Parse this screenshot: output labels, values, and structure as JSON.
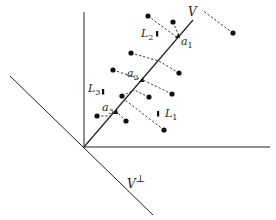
{
  "diagram": {
    "origin": [
      84,
      147
    ],
    "axes": {
      "vertical": {
        "from": [
          84,
          147
        ],
        "to": [
          84,
          12
        ]
      },
      "horizontal": {
        "from": [
          84,
          147
        ],
        "to": [
          270,
          147
        ]
      },
      "v_perp": {
        "from": [
          10,
          76
        ],
        "to": [
          153,
          215
        ],
        "label": "V",
        "label_sup": "⊥"
      },
      "v": {
        "from": [
          84,
          147
        ],
        "to": [
          193,
          20
        ],
        "label": "V"
      }
    },
    "points": [
      {
        "p": [
          148,
          16
        ],
        "proj": [
          178,
          38
        ]
      },
      {
        "p": [
          173,
          22
        ],
        "proj": [
          179,
          36
        ]
      },
      {
        "p": [
          233,
          33
        ],
        "proj": [
          202,
          10
        ]
      },
      {
        "p": [
          131,
          53
        ],
        "proj": [
          159,
          61
        ]
      },
      {
        "p": [
          113,
          70
        ],
        "proj": [
          143,
          80
        ]
      },
      {
        "p": [
          179,
          73
        ],
        "proj": [
          159,
          61
        ]
      },
      {
        "p": [
          172,
          94
        ],
        "proj": [
          143,
          80
        ]
      },
      {
        "p": [
          149,
          97
        ],
        "proj": [
          134,
          90
        ]
      },
      {
        "p": [
          122,
          96
        ],
        "proj": [
          134,
          90
        ]
      },
      {
        "p": [
          97,
          116
        ],
        "proj": [
          111,
          116
        ]
      },
      {
        "p": [
          126,
          121
        ],
        "proj": [
          116,
          111
        ]
      },
      {
        "p": [
          164,
          130
        ],
        "proj": [
          125,
          100
        ]
      }
    ],
    "anchors": [
      {
        "name": "a1",
        "base": "a",
        "sub": "1",
        "pos": [
          178,
          36
        ],
        "label_pos": [
          181,
          45
        ]
      },
      {
        "name": "a2",
        "base": "a",
        "sub": "2",
        "pos": [
          142,
          80
        ],
        "label_pos": [
          127,
          77
        ]
      },
      {
        "name": "a3",
        "base": "a",
        "sub": "3",
        "pos": [
          116,
          112
        ],
        "label_pos": [
          102,
          111
        ]
      }
    ],
    "line_labels": [
      {
        "name": "L1",
        "base": "L",
        "sub": "1",
        "mark": [
          158,
          114
        ],
        "label_pos": [
          165,
          117
        ]
      },
      {
        "name": "L2",
        "base": "L",
        "sub": "2",
        "mark": [
          157,
          34
        ],
        "label_pos": [
          141,
          37
        ]
      },
      {
        "name": "L3",
        "base": "L",
        "sub": "3",
        "mark": [
          103,
          92
        ],
        "label_pos": [
          88,
          92
        ]
      }
    ],
    "colors": {
      "stroke": "#222222",
      "dots": "#111111"
    }
  }
}
